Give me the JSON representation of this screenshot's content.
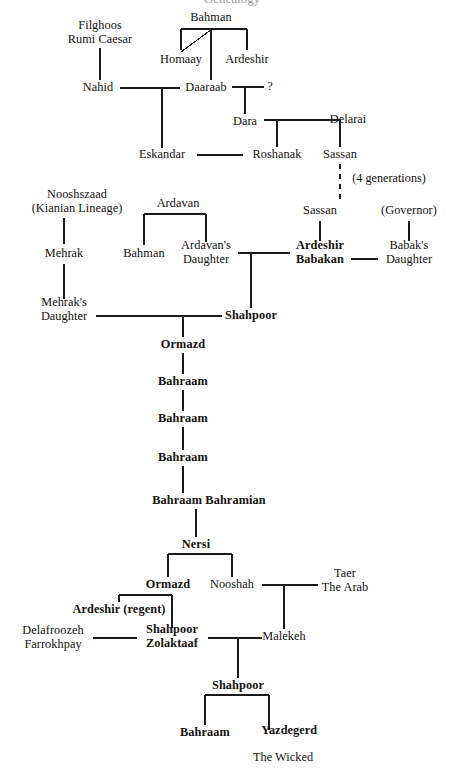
{
  "document": {
    "title": "Sassanian Royal Lineage Chart",
    "background_color": "#ffffff",
    "line_color": "#1a1a1a",
    "text_color": "#14120f",
    "cropped_heading": "Genealogy"
  },
  "legend": {
    "bold_meaning": "Reigning monarch",
    "dashed_meaning": "Omitted generations"
  },
  "nodes": [
    {
      "id": "filghoos",
      "label": "Filghoos\nRumi Caesar",
      "x": 100,
      "y": 33,
      "bold": false
    },
    {
      "id": "bahman-top",
      "label": "Bahman",
      "x": 211,
      "y": 18,
      "bold": false
    },
    {
      "id": "homaay",
      "label": "Homaay",
      "x": 181,
      "y": 60,
      "bold": false
    },
    {
      "id": "ardeshir-top",
      "label": "Ardeshir",
      "x": 247,
      "y": 60,
      "bold": false
    },
    {
      "id": "nahid",
      "label": "Nahid",
      "x": 98,
      "y": 88,
      "bold": false
    },
    {
      "id": "daaraab",
      "label": "Daaraab",
      "x": 206,
      "y": 88,
      "bold": false
    },
    {
      "id": "unknown-spouse",
      "label": "?",
      "x": 270,
      "y": 87,
      "bold": false
    },
    {
      "id": "dara",
      "label": "Dara",
      "x": 245,
      "y": 122,
      "bold": false
    },
    {
      "id": "delarai",
      "label": "Delarai",
      "x": 348,
      "y": 120,
      "bold": false
    },
    {
      "id": "eskandar",
      "label": "Eskandar",
      "x": 162,
      "y": 155,
      "bold": false
    },
    {
      "id": "roshanak",
      "label": "Roshanak",
      "x": 277,
      "y": 155,
      "bold": false
    },
    {
      "id": "sassan-1",
      "label": "Sassan",
      "x": 340,
      "y": 155,
      "bold": false
    },
    {
      "id": "four-generations",
      "label": "(4 generations)",
      "x": 389,
      "y": 179,
      "bold": false,
      "note": true
    },
    {
      "id": "nooshszaad",
      "label": "Nooshszaad\n(Kianian Lineage)",
      "x": 77,
      "y": 202,
      "bold": false
    },
    {
      "id": "ardavan",
      "label": "Ardavan",
      "x": 178,
      "y": 204,
      "bold": false
    },
    {
      "id": "sassan-2",
      "label": "Sassan",
      "x": 320,
      "y": 211,
      "bold": false
    },
    {
      "id": "governor",
      "label": "(Governor)",
      "x": 409,
      "y": 211,
      "bold": false
    },
    {
      "id": "mehrak",
      "label": "Mehrak",
      "x": 64,
      "y": 254,
      "bold": false
    },
    {
      "id": "bahman-2",
      "label": "Bahman",
      "x": 144,
      "y": 254,
      "bold": false
    },
    {
      "id": "ardavans-dau",
      "label": "Ardavan's\nDaughter",
      "x": 206,
      "y": 253,
      "bold": false
    },
    {
      "id": "ardeshir-babakan",
      "label": "Ardeshir\nBabakan",
      "x": 320,
      "y": 253,
      "bold": true
    },
    {
      "id": "babaks-dau",
      "label": "Babak's\nDaughter",
      "x": 409,
      "y": 253,
      "bold": false
    },
    {
      "id": "mehraks-dau",
      "label": "Mehrak's\nDaughter",
      "x": 64,
      "y": 310,
      "bold": false
    },
    {
      "id": "shahpoor-1",
      "label": "Shahpoor",
      "x": 251,
      "y": 316,
      "bold": true
    },
    {
      "id": "ormazd-1",
      "label": "Ormazd",
      "x": 183,
      "y": 345,
      "bold": true
    },
    {
      "id": "bahraam-1",
      "label": "Bahraam",
      "x": 183,
      "y": 382,
      "bold": true
    },
    {
      "id": "bahraam-2",
      "label": "Bahraam",
      "x": 183,
      "y": 419,
      "bold": true
    },
    {
      "id": "bahraam-3",
      "label": "Bahraam",
      "x": 183,
      "y": 458,
      "bold": true
    },
    {
      "id": "bahraam-bahramian",
      "label": "Bahraam Bahramian",
      "x": 209,
      "y": 501,
      "bold": true
    },
    {
      "id": "nersi",
      "label": "Nersi",
      "x": 196,
      "y": 545,
      "bold": true
    },
    {
      "id": "ormazd-2",
      "label": "Ormazd",
      "x": 168,
      "y": 585,
      "bold": true
    },
    {
      "id": "nooshah",
      "label": "Nooshah",
      "x": 232,
      "y": 585,
      "bold": false
    },
    {
      "id": "taer",
      "label": "Taer\nThe Arab",
      "x": 345,
      "y": 581,
      "bold": false
    },
    {
      "id": "ardeshir-regent",
      "label": "Ardeshir (regent)",
      "x": 119,
      "y": 610,
      "bold": true
    },
    {
      "id": "delafroozeh",
      "label": "Delafroozeh\nFarrokhpay",
      "x": 53,
      "y": 638,
      "bold": false
    },
    {
      "id": "shahpoor-zolaktaaf",
      "label": "Shahpoor\nZolaktaaf",
      "x": 172,
      "y": 637,
      "bold": true
    },
    {
      "id": "malekeh",
      "label": "Malekeh",
      "x": 284,
      "y": 637,
      "bold": false
    },
    {
      "id": "shahpoor-2",
      "label": "Shahpoor",
      "x": 238,
      "y": 686,
      "bold": true
    },
    {
      "id": "bahraam-4",
      "label": "Bahraam",
      "x": 205,
      "y": 733,
      "bold": true
    },
    {
      "id": "yazdegerd",
      "label": "Yazdegerd\nThe Wicked",
      "x": 283,
      "y": 738,
      "bold": false,
      "first_line_bold": true
    }
  ],
  "connections": [
    {
      "from": "bahman-top",
      "to": "homaay",
      "kind": "descent"
    },
    {
      "from": "bahman-top",
      "to": "ardeshir-top",
      "kind": "descent"
    },
    {
      "from": "homaay",
      "to": "daaraab",
      "kind": "descent"
    },
    {
      "from": "filghoos",
      "to": "nahid",
      "kind": "descent"
    },
    {
      "from": "nahid",
      "to": "daaraab",
      "kind": "marriage"
    },
    {
      "from": "daaraab",
      "to": "unknown-spouse",
      "kind": "marriage"
    },
    {
      "from": "nahid+daaraab",
      "to": "eskandar",
      "kind": "descent"
    },
    {
      "from": "daaraab+unknown",
      "to": "dara",
      "kind": "descent"
    },
    {
      "from": "dara",
      "to": "delarai",
      "kind": "marriage"
    },
    {
      "from": "dara+delarai",
      "to": "roshanak",
      "kind": "descent"
    },
    {
      "from": "dara+delarai",
      "to": "sassan-1",
      "kind": "descent"
    },
    {
      "from": "eskandar",
      "to": "roshanak",
      "kind": "marriage"
    },
    {
      "from": "sassan-1",
      "to": "sassan-2",
      "kind": "dashed-descent"
    },
    {
      "from": "nooshszaad",
      "to": "mehrak",
      "kind": "descent"
    },
    {
      "from": "mehrak",
      "to": "mehraks-dau",
      "kind": "descent"
    },
    {
      "from": "ardavan",
      "to": "bahman-2",
      "kind": "descent"
    },
    {
      "from": "ardavan",
      "to": "ardavans-dau",
      "kind": "descent"
    },
    {
      "from": "sassan-2",
      "to": "ardeshir-babakan",
      "kind": "descent"
    },
    {
      "from": "governor",
      "to": "babaks-dau",
      "kind": "descent"
    },
    {
      "from": "ardeshir-babakan",
      "to": "babaks-dau",
      "kind": "marriage"
    },
    {
      "from": "ardavans-dau",
      "to": "ardeshir-babakan",
      "kind": "marriage"
    },
    {
      "from": "ardavans-dau+ardeshir",
      "to": "shahpoor-1",
      "kind": "descent"
    },
    {
      "from": "mehraks-dau",
      "to": "shahpoor-1",
      "kind": "marriage"
    },
    {
      "from": "mehraks-dau+shahpoor",
      "to": "ormazd-1",
      "kind": "descent"
    },
    {
      "from": "ormazd-1",
      "to": "bahraam-1",
      "kind": "descent"
    },
    {
      "from": "bahraam-1",
      "to": "bahraam-2",
      "kind": "descent"
    },
    {
      "from": "bahraam-2",
      "to": "bahraam-3",
      "kind": "descent"
    },
    {
      "from": "bahraam-3",
      "to": "bahraam-bahramian",
      "kind": "descent"
    },
    {
      "from": "bahraam-bahramian",
      "to": "nersi",
      "kind": "descent"
    },
    {
      "from": "nersi",
      "to": "ormazd-2",
      "kind": "descent"
    },
    {
      "from": "nersi",
      "to": "nooshah",
      "kind": "descent"
    },
    {
      "from": "nooshah",
      "to": "taer",
      "kind": "marriage"
    },
    {
      "from": "nooshah+taer",
      "to": "malekeh",
      "kind": "descent"
    },
    {
      "from": "ormazd-2",
      "to": "ardeshir-regent",
      "kind": "descent"
    },
    {
      "from": "ormazd-2",
      "to": "shahpoor-zolaktaaf",
      "kind": "descent"
    },
    {
      "from": "delafroozeh",
      "to": "shahpoor-zolaktaaf",
      "kind": "marriage"
    },
    {
      "from": "shahpoor-zolaktaaf",
      "to": "malekeh",
      "kind": "marriage"
    },
    {
      "from": "shahpoor-zolaktaaf+malekeh",
      "to": "shahpoor-2",
      "kind": "descent"
    },
    {
      "from": "shahpoor-2",
      "to": "bahraam-4",
      "kind": "descent"
    },
    {
      "from": "shahpoor-2",
      "to": "yazdegerd",
      "kind": "descent"
    }
  ]
}
